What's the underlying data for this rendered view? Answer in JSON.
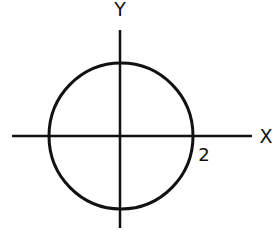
{
  "diagram": {
    "type": "circle-on-axes",
    "axes": {
      "x_label": "X",
      "y_label": "Y"
    },
    "circle": {
      "center": [
        0,
        0
      ],
      "radius": 2,
      "radius_label": "2"
    },
    "colors": {
      "stroke": "#111111",
      "background": "#ffffff"
    }
  }
}
